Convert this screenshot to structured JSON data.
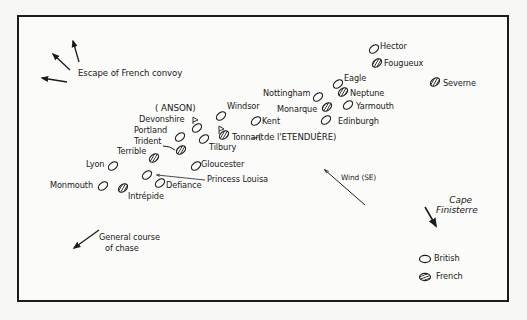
{
  "diagram": {
    "title_annotations": {
      "escape": "Escape of  French convoy",
      "course": [
        "General course",
        "of chase"
      ],
      "wind": "Wind (SE)",
      "cape": [
        "Cape",
        "Finisterre"
      ],
      "anson": "( ANSON)",
      "etenduere": "-( de l'ETENDUÈRE)"
    },
    "legend": [
      {
        "label": "British",
        "fill": "none"
      },
      {
        "label": "French",
        "fill": "hatched"
      }
    ],
    "ships": [
      {
        "name": "Hector",
        "side": "British",
        "x": 374,
        "y": 49
      },
      {
        "name": "Fougueux",
        "side": "French",
        "x": 377,
        "y": 63
      },
      {
        "name": "Severne",
        "side": "French",
        "x": 435,
        "y": 82
      },
      {
        "name": "Eagle",
        "side": "British",
        "x": 338,
        "y": 84
      },
      {
        "name": "Neptune",
        "side": "French",
        "x": 343,
        "y": 92
      },
      {
        "name": "Nottingham",
        "side": "British",
        "x": 318,
        "y": 97
      },
      {
        "name": "Monarque",
        "side": "French",
        "x": 327,
        "y": 107
      },
      {
        "name": "Yarmouth",
        "side": "British",
        "x": 348,
        "y": 105
      },
      {
        "name": "Edinburgh",
        "side": "British",
        "x": 326,
        "y": 120
      },
      {
        "name": "Windsor",
        "side": "British",
        "x": 221,
        "y": 116
      },
      {
        "name": "Kent",
        "side": "British",
        "x": 256,
        "y": 121
      },
      {
        "name": "Devonshire",
        "side": "British",
        "x": 197,
        "y": 128
      },
      {
        "name": "Portland",
        "side": "British",
        "x": 180,
        "y": 137
      },
      {
        "name": "Tonnant",
        "side": "French",
        "x": 224,
        "y": 135
      },
      {
        "name": "Tilbury",
        "side": "British",
        "x": 204,
        "y": 139
      },
      {
        "name": "Trident",
        "side": "French",
        "x": 181,
        "y": 150
      },
      {
        "name": "Terrible",
        "side": "French",
        "x": 154,
        "y": 158
      },
      {
        "name": "Gloucester",
        "side": "British",
        "x": 196,
        "y": 166
      },
      {
        "name": "Lyon",
        "side": "British",
        "x": 113,
        "y": 166
      },
      {
        "name": "Princess Louisa",
        "side": "British",
        "x": 147,
        "y": 175
      },
      {
        "name": "Defiance",
        "side": "British",
        "x": 160,
        "y": 183
      },
      {
        "name": "Monmouth",
        "side": "British",
        "x": 103,
        "y": 186
      },
      {
        "name": "Intrépide",
        "side": "French",
        "x": 123,
        "y": 188
      }
    ],
    "colors": {
      "ink": "#1c1c1c",
      "paper": "#fbfbf9"
    }
  }
}
